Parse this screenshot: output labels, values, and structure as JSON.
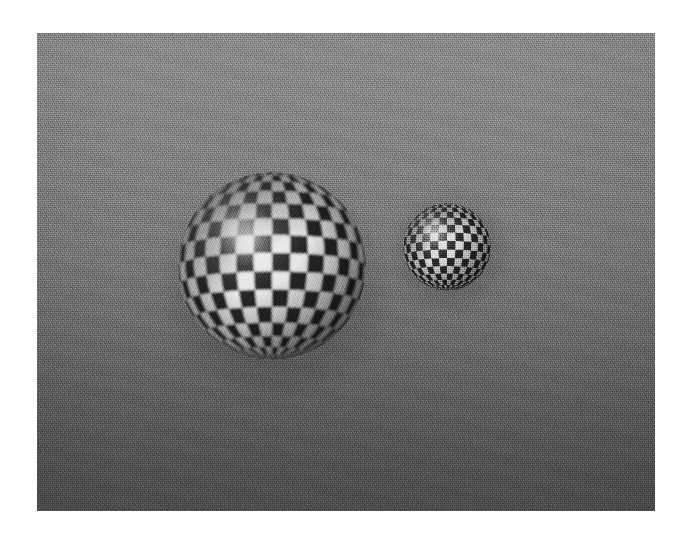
{
  "scene": {
    "title": "Checkered spheres on a grey backdrop",
    "description": "Two procedurally textured checkerboard spheres rendered against a smooth grey gradient backdrop with film grain.",
    "page_background": "#ffffff",
    "panel": {
      "name": "rendered-image-panel",
      "left": 37,
      "top": 33,
      "width": 618,
      "height": 478
    },
    "backdrop": {
      "top_color": "#8d8d8d",
      "mid_color": "#7c7c7c",
      "bottom_color": "#4e4e4e",
      "gradient_direction": "vertical",
      "grain": "film-grain"
    },
    "lighting": {
      "key_light_direction": "upper-left",
      "specular_color": "#ffffff",
      "shadow_color": "#000000"
    },
    "objects": [
      {
        "id": "large-sphere",
        "label": "Large checkered sphere",
        "shape": "sphere",
        "center_x": 270,
        "center_y": 266,
        "diameter": 188,
        "texture": "checkerboard",
        "checker_longitudes": 32,
        "checker_latitudes": 16,
        "checker_light": "#e8e8e8",
        "checker_dark": "#262626",
        "highlight_x_pct": 30,
        "highlight_y_pct": 26
      },
      {
        "id": "small-sphere",
        "label": "Small checkered sphere",
        "shape": "sphere",
        "center_x": 447,
        "center_y": 247,
        "diameter": 88,
        "texture": "checkerboard",
        "checker_longitudes": 32,
        "checker_latitudes": 16,
        "checker_light": "#dcdcdc",
        "checker_dark": "#2b2b2b",
        "highlight_x_pct": 32,
        "highlight_y_pct": 28
      }
    ]
  }
}
